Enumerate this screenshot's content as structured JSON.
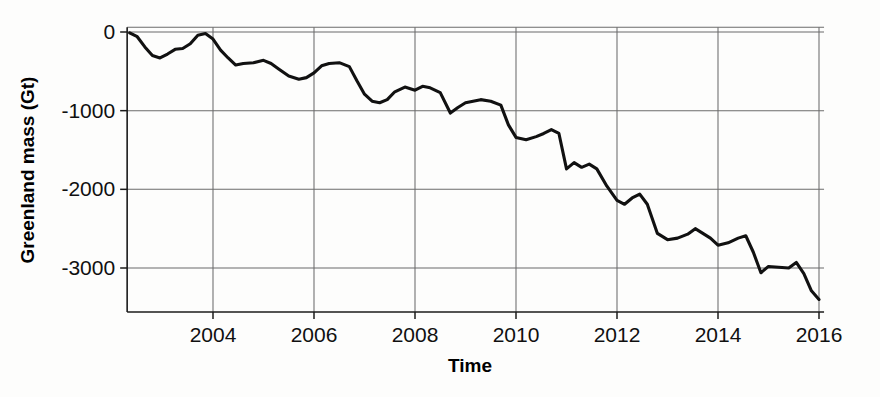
{
  "chart_data": {
    "type": "line",
    "title": "",
    "xlabel": "Time",
    "ylabel": "Greenland mass (Gt)",
    "xlim": [
      2002.3,
      2016.1
    ],
    "ylim": [
      -3560,
      60
    ],
    "xticks": [
      2004,
      2006,
      2008,
      2010,
      2012,
      2014,
      2016
    ],
    "xtick_labels": [
      "2004",
      "2006",
      "2008",
      "2010",
      "2012",
      "2014",
      "2016"
    ],
    "yticks": [
      0,
      -1000,
      -2000,
      -3000
    ],
    "ytick_labels": [
      "0",
      "-1000",
      "-2000",
      "-3000"
    ],
    "grid": true,
    "legend": "none",
    "line_color": "#111111",
    "series": [
      {
        "name": "Greenland ice mass anomaly",
        "units": "Gt",
        "x": [
          2002.35,
          2002.5,
          2002.65,
          2002.8,
          2002.95,
          2003.1,
          2003.25,
          2003.4,
          2003.55,
          2003.7,
          2003.85,
          2004.0,
          2004.15,
          2004.3,
          2004.45,
          2004.6,
          2004.8,
          2005.0,
          2005.15,
          2005.3,
          2005.5,
          2005.7,
          2005.85,
          2006.0,
          2006.15,
          2006.3,
          2006.5,
          2006.7,
          2006.85,
          2007.0,
          2007.15,
          2007.3,
          2007.45,
          2007.6,
          2007.8,
          2008.0,
          2008.15,
          2008.3,
          2008.5,
          2008.7,
          2008.85,
          2009.0,
          2009.15,
          2009.3,
          2009.5,
          2009.7,
          2009.85,
          2010.0,
          2010.2,
          2010.4,
          2010.55,
          2010.7,
          2010.85,
          2011.0,
          2011.15,
          2011.3,
          2011.45,
          2011.6,
          2011.8,
          2012.0,
          2012.15,
          2012.3,
          2012.45,
          2012.6,
          2012.8,
          2013.0,
          2013.2,
          2013.4,
          2013.55,
          2013.7,
          2013.85,
          2014.0,
          2014.2,
          2014.4,
          2014.55,
          2014.7,
          2014.85,
          2015.0,
          2015.2,
          2015.4,
          2015.55,
          2015.7,
          2015.85,
          2016.0
        ],
        "y": [
          -10,
          -60,
          -190,
          -300,
          -330,
          -280,
          -220,
          -210,
          -150,
          -40,
          -20,
          -90,
          -230,
          -330,
          -420,
          -400,
          -390,
          -360,
          -400,
          -470,
          -560,
          -600,
          -580,
          -520,
          -430,
          -400,
          -390,
          -440,
          -620,
          -790,
          -880,
          -900,
          -860,
          -760,
          -700,
          -740,
          -690,
          -710,
          -770,
          -1030,
          -960,
          -900,
          -880,
          -860,
          -880,
          -930,
          -1180,
          -1340,
          -1370,
          -1330,
          -1290,
          -1240,
          -1290,
          -1740,
          -1660,
          -1720,
          -1680,
          -1740,
          -1960,
          -2140,
          -2190,
          -2110,
          -2060,
          -2190,
          -2560,
          -2640,
          -2620,
          -2570,
          -2500,
          -2560,
          -2620,
          -2710,
          -2680,
          -2620,
          -2590,
          -2800,
          -3060,
          -2980,
          -2990,
          -3000,
          -2930,
          -3070,
          -3290,
          -3400
        ]
      }
    ],
    "annotations": []
  },
  "axis": {
    "y_title": "Greenland mass (Gt)",
    "x_title": "Time"
  }
}
